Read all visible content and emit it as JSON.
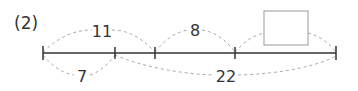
{
  "problem_label": "(2)",
  "number_line": {
    "ticks_x": [
      43,
      115,
      155,
      235,
      336
    ],
    "line_y": 53
  },
  "arcs": [
    {
      "id": "top-11",
      "from": 0,
      "to": 2,
      "label": "11",
      "position": "above"
    },
    {
      "id": "top-8",
      "from": 2,
      "to": 3,
      "label": "8",
      "position": "above"
    },
    {
      "id": "top-box",
      "from": 3,
      "to": 4,
      "label": "",
      "position": "above",
      "answer_box": true
    },
    {
      "id": "bottom-7",
      "from": 0,
      "to": 1,
      "label": "7",
      "position": "below"
    },
    {
      "id": "bottom-22",
      "from": 1,
      "to": 4,
      "label": "22",
      "position": "below"
    }
  ],
  "answer_box": {
    "value": ""
  },
  "colors": {
    "line": "#333333",
    "dash": "#aaaaaa",
    "box": "#999999",
    "text": "#333333"
  }
}
